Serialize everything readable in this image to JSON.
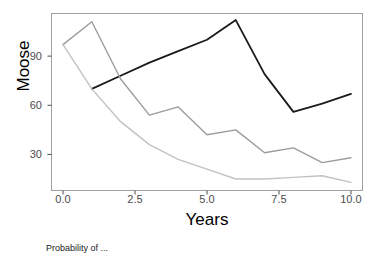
{
  "chart_data": {
    "type": "line",
    "title": "",
    "xlabel": "Years",
    "ylabel": "Moose",
    "xlim": [
      -0.4,
      10.4
    ],
    "ylim": [
      8,
      116
    ],
    "xticks": [
      0.0,
      2.5,
      5.0,
      7.5,
      10.0
    ],
    "xtick_labels": [
      "0.0",
      "2.5",
      "5.0",
      "7.5",
      "10.0"
    ],
    "yticks": [
      30,
      60,
      90
    ],
    "ytick_labels": [
      "30",
      "60",
      "90"
    ],
    "grid": false,
    "legend_position": "bottom",
    "legend_title": "Probability of ...",
    "x": [
      0,
      1,
      2,
      3,
      4,
      5,
      6,
      7,
      8,
      9,
      10
    ],
    "series": [
      {
        "name": "dark",
        "color": "#1a1a1a",
        "x": [
          1,
          2,
          3,
          4,
          5,
          6,
          7,
          8,
          9,
          10
        ],
        "values": [
          70,
          78,
          86,
          93,
          100,
          112,
          79,
          56,
          61,
          67
        ]
      },
      {
        "name": "medium-gray",
        "color": "#9c9c9c",
        "x": [
          0,
          1,
          2,
          3,
          4,
          5,
          6,
          7,
          8,
          9,
          10
        ],
        "values": [
          97,
          111,
          76,
          54,
          59,
          42,
          45,
          31,
          34,
          25,
          28
        ]
      },
      {
        "name": "light-gray",
        "color": "#c2c2c2",
        "x": [
          0,
          1,
          2,
          3,
          4,
          5,
          6,
          7,
          8,
          9,
          10
        ],
        "values": [
          97,
          70,
          50,
          36,
          27,
          21,
          15,
          15,
          16,
          17,
          13
        ]
      }
    ]
  },
  "axes": {
    "y_label": "Moose",
    "x_label": "Years"
  },
  "panel": {
    "border_color": "#a0a0a0",
    "background": "#ffffff"
  },
  "legend": {
    "title_text": "Probability of ..."
  }
}
